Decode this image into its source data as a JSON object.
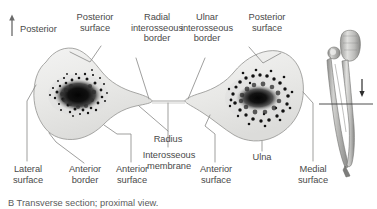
{
  "figure": {
    "orientation": {
      "label": "Posterior",
      "icon": "up-arrow-icon"
    },
    "caption": "B  Transverse section; proximal view.",
    "labels": {
      "posterior_surface_radius": "Posterior\nsurface",
      "radial_interosseous_border": "Radial\ninterosseous\nborder",
      "ulnar_interosseous_border": "Ulnar\ninterosseous\nborder",
      "posterior_surface_ulna": "Posterior\nsurface",
      "lateral_surface": "Lateral\nsurface",
      "anterior_border": "Anterior\nborder",
      "anterior_surface_radius": "Anterior\nsurface",
      "radius": "Radius",
      "interosseous_membrane": "Interosseous\nmembrane",
      "anterior_surface_ulna": "Anterior\nsurface",
      "ulna": "Ulna",
      "medial_surface": "Medial\nsurface"
    },
    "inset": {
      "name": "forearm-bones-inset",
      "section_line": "transverse-section-level",
      "arrow": "view-direction-arrow"
    },
    "colors": {
      "bone_fill": "#e9e9e7",
      "bone_outline": "#9a9a98",
      "marrow": "#1a1a1a",
      "leader_line": "#8a8a88",
      "text": "#4a4a4a",
      "background": "#ffffff",
      "inset_bone": "#b4b4b2"
    }
  }
}
